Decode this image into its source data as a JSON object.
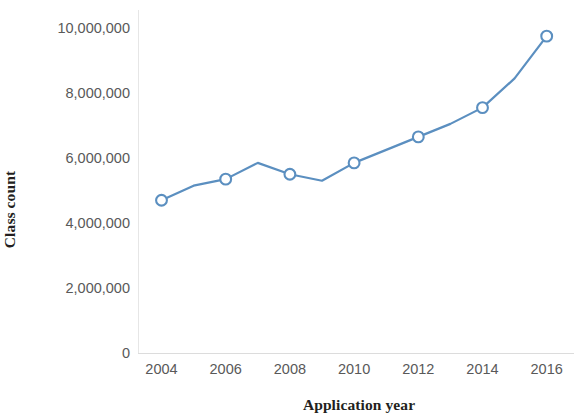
{
  "chart_data": {
    "type": "line",
    "title": "",
    "subtitle": "",
    "xlabel": "Application year",
    "ylabel": "Class count",
    "x": [
      2004,
      2005,
      2006,
      2007,
      2008,
      2009,
      2010,
      2011,
      2012,
      2013,
      2014,
      2015,
      2016
    ],
    "values": [
      4700000,
      5150000,
      5350000,
      5850000,
      5500000,
      5300000,
      5850000,
      6250000,
      6650000,
      7050000,
      7550000,
      8450000,
      9750000
    ],
    "series": [
      {
        "name": "Class count",
        "values": [
          4700000,
          5150000,
          5350000,
          5850000,
          5500000,
          5300000,
          5850000,
          6250000,
          6650000,
          7050000,
          7550000,
          8450000,
          9750000
        ],
        "color": "#5B8FC0",
        "marker": "open-circle",
        "marked_x": [
          2004,
          2006,
          2008,
          2010,
          2012,
          2014,
          2016
        ]
      }
    ],
    "xtick_labels": [
      "2004",
      "2006",
      "2008",
      "2010",
      "2012",
      "2014",
      "2016"
    ],
    "xtick_values": [
      2004,
      2006,
      2008,
      2010,
      2012,
      2014,
      2016
    ],
    "ytick_labels": [
      "10,000,000",
      "8,000,000",
      "6,000,000",
      "4,000,000",
      "2,000,000",
      "0"
    ],
    "ytick_values": [
      10000000,
      8000000,
      6000000,
      4000000,
      2000000,
      0
    ],
    "xlim": [
      2003.5,
      2016.5
    ],
    "ylim": [
      0,
      10000000
    ],
    "grid": false,
    "legend": null,
    "legend_position": "none",
    "annotations": [],
    "colors": {
      "line": "#5B8FC0",
      "marker_fill": "#ffffff",
      "marker_stroke": "#5B8FC0",
      "axis": "#e2e2e2",
      "tick_text": "#595959",
      "title_text": "#231f20",
      "background": "#ffffff"
    }
  }
}
